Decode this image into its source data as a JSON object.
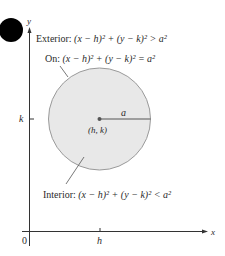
{
  "diagram": {
    "axes": {
      "x_label": "x",
      "y_label": "y",
      "origin_label": "0",
      "x_tick_label": "h",
      "y_tick_label": "k"
    },
    "circle": {
      "center_label": "(h, k)",
      "radius_label": "a",
      "fill": "#e8e8e8",
      "stroke": "#9a9a9a"
    },
    "labels": {
      "exterior_prefix": "Exterior: ",
      "exterior_formula": "(x − h)² + (y − k)² > a²",
      "on_prefix": "On: ",
      "on_formula": "(x − h)² + (y − k)² = a²",
      "interior_prefix": "Interior: ",
      "interior_formula": "(x − h)² + (y − k)² < a²"
    },
    "colors": {
      "dot": "#000000",
      "axis": "#333333"
    }
  }
}
